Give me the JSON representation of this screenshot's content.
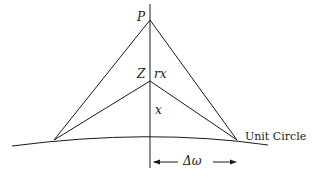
{
  "diagram": {
    "labels": {
      "P": "P",
      "Z": "Z",
      "rx": "rx",
      "x": "x",
      "delta_omega": "Δω",
      "unit_circle": "Unit Circle"
    },
    "colors": {
      "stroke": "#1a1a1a",
      "background": "#ffffff"
    },
    "points": {
      "P": [
        150,
        20
      ],
      "Z": [
        150,
        81
      ],
      "left_base": [
        54,
        140
      ],
      "right_base": [
        237,
        140
      ],
      "axis_top": [
        150,
        4
      ],
      "axis_bottom": [
        150,
        168
      ]
    }
  }
}
